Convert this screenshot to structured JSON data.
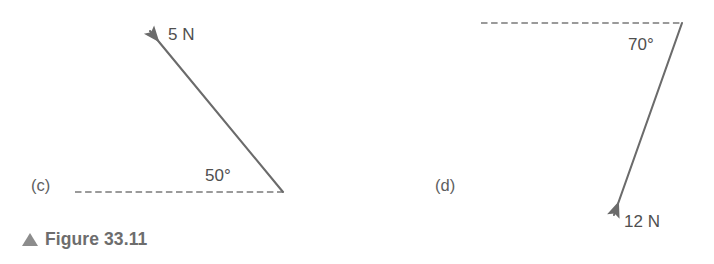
{
  "figure": {
    "caption_marker": "triangle-up-icon",
    "caption_text": "Figure 33.11",
    "stroke_color": "#6b6b6b",
    "dash_color": "#9a9a9a",
    "text_color": "#4f4f4f",
    "caption_color": "#6d6d6d"
  },
  "panels": [
    {
      "id": "c",
      "label": "(c)",
      "force_label": "5 N",
      "angle_label": "50°",
      "vector": {
        "tail_x": 283,
        "tail_y": 192,
        "tip_x": 146,
        "tip_y": 27,
        "magnitude": 5,
        "unit": "N",
        "angle_deg": 50,
        "angle_from": "horizontal-dashed-line",
        "direction": "up-left"
      },
      "reference_line": {
        "x1": 75,
        "y1": 192,
        "x2": 283,
        "y2": 192,
        "style": "dashed"
      }
    },
    {
      "id": "d",
      "label": "(d)",
      "force_label": "12 N",
      "angle_label": "70°",
      "vector": {
        "tail_x": 682,
        "tail_y": 23,
        "tip_x": 611,
        "tip_y": 223,
        "magnitude": 12,
        "unit": "N",
        "angle_deg": 70,
        "angle_from": "horizontal-dashed-line",
        "direction": "down-left"
      },
      "reference_line": {
        "x1": 481,
        "y1": 23,
        "x2": 682,
        "y2": 23,
        "style": "dashed"
      }
    }
  ]
}
